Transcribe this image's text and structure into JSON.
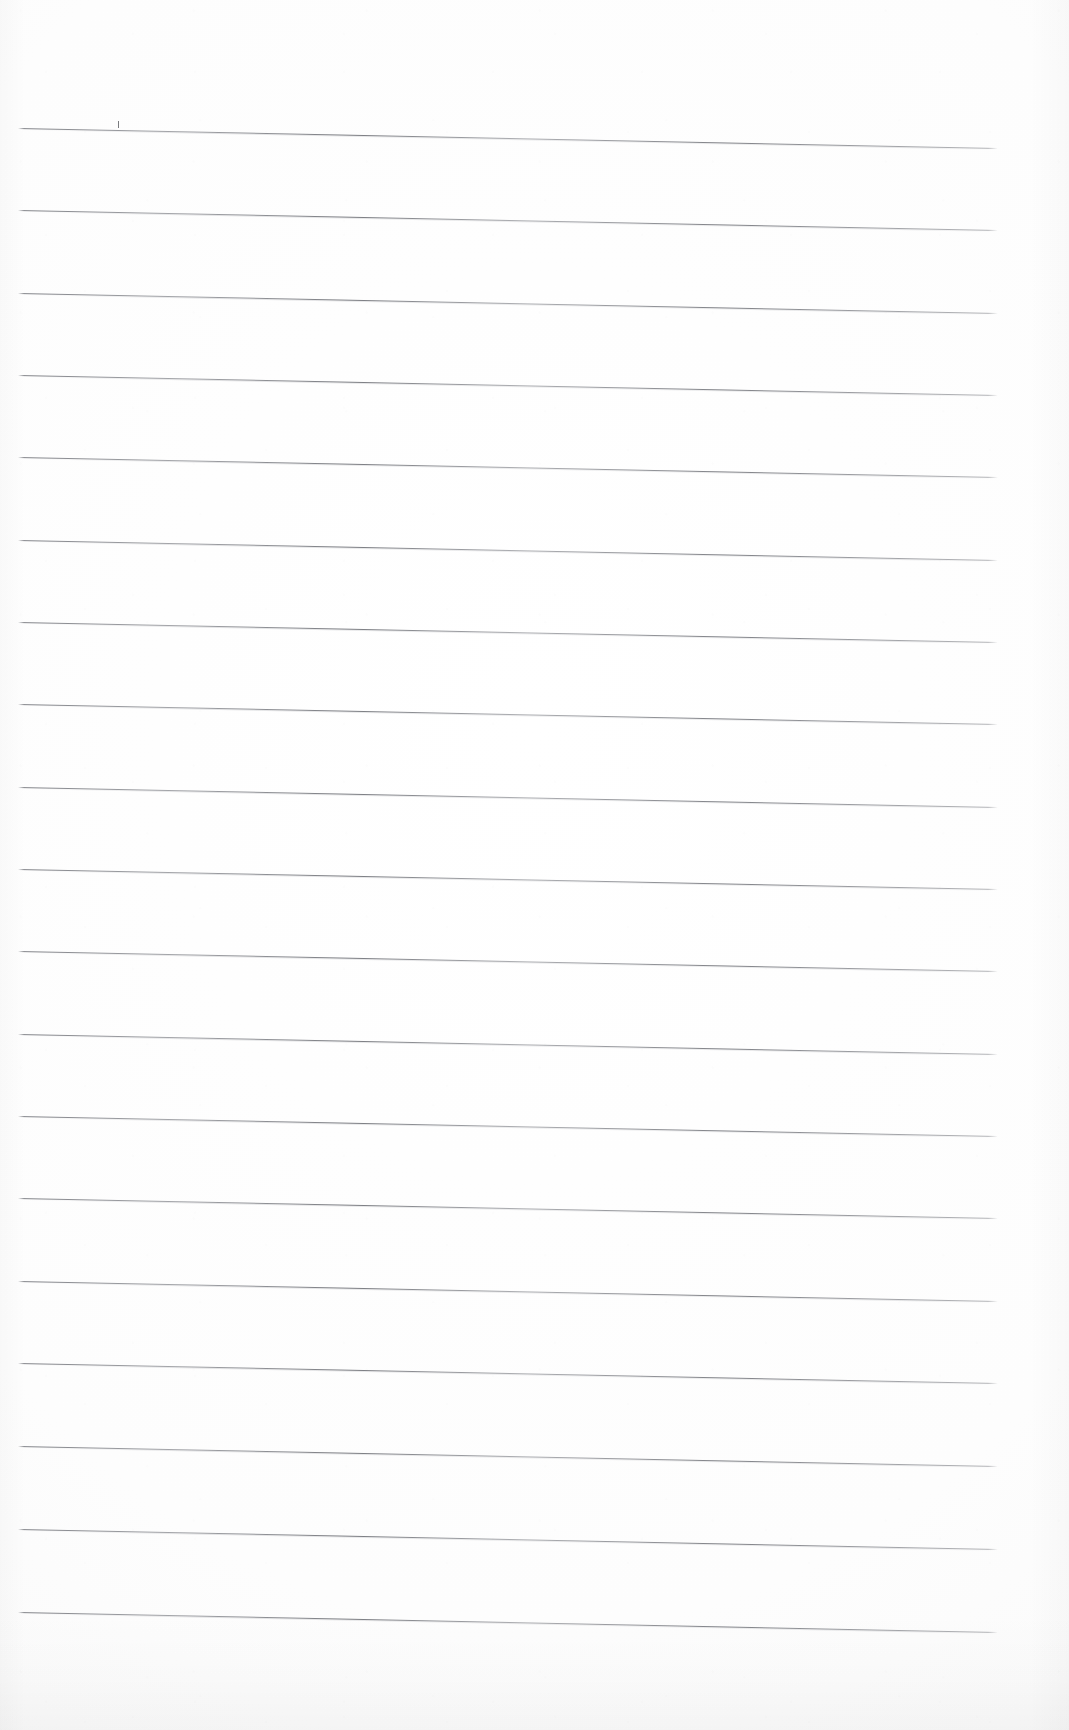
{
  "document": {
    "kind": "scanned-lined-paper",
    "title": "Blank ruled notebook page",
    "page_width": 1069,
    "page_height": 1730,
    "background_color": "#fefefe",
    "rule_color": "#6e7076",
    "rule_thickness_px": 1,
    "content_text": "",
    "has_handwriting": false,
    "has_vertical_margin_rule": false
  },
  "ruling": {
    "line_count": 19,
    "left_x": 18,
    "right_x": 998,
    "first_line_y_left": 128,
    "last_line_y_left": 1612,
    "spacing_px": 82.4,
    "slope_px_over_span": 20,
    "lines": [
      {
        "index": 1,
        "y_left": 128,
        "y_right": 148
      },
      {
        "index": 2,
        "y_left": 210,
        "y_right": 230
      },
      {
        "index": 3,
        "y_left": 293,
        "y_right": 313
      },
      {
        "index": 4,
        "y_left": 375,
        "y_right": 395
      },
      {
        "index": 5,
        "y_left": 457,
        "y_right": 477
      },
      {
        "index": 6,
        "y_left": 540,
        "y_right": 560
      },
      {
        "index": 7,
        "y_left": 622,
        "y_right": 642
      },
      {
        "index": 8,
        "y_left": 704,
        "y_right": 724
      },
      {
        "index": 9,
        "y_left": 787,
        "y_right": 807
      },
      {
        "index": 10,
        "y_left": 869,
        "y_right": 889
      },
      {
        "index": 11,
        "y_left": 951,
        "y_right": 971
      },
      {
        "index": 12,
        "y_left": 1034,
        "y_right": 1054
      },
      {
        "index": 13,
        "y_left": 1116,
        "y_right": 1136
      },
      {
        "index": 14,
        "y_left": 1198,
        "y_right": 1218
      },
      {
        "index": 15,
        "y_left": 1281,
        "y_right": 1301
      },
      {
        "index": 16,
        "y_left": 1363,
        "y_right": 1383
      },
      {
        "index": 17,
        "y_left": 1446,
        "y_right": 1466
      },
      {
        "index": 18,
        "y_left": 1529,
        "y_right": 1549
      },
      {
        "index": 19,
        "y_left": 1612,
        "y_right": 1632
      }
    ]
  },
  "marks": [
    {
      "name": "pencil-tick",
      "description": "small vertical pencil tick just above the first ruled line",
      "x": 118,
      "y": 121,
      "height": 7
    }
  ]
}
